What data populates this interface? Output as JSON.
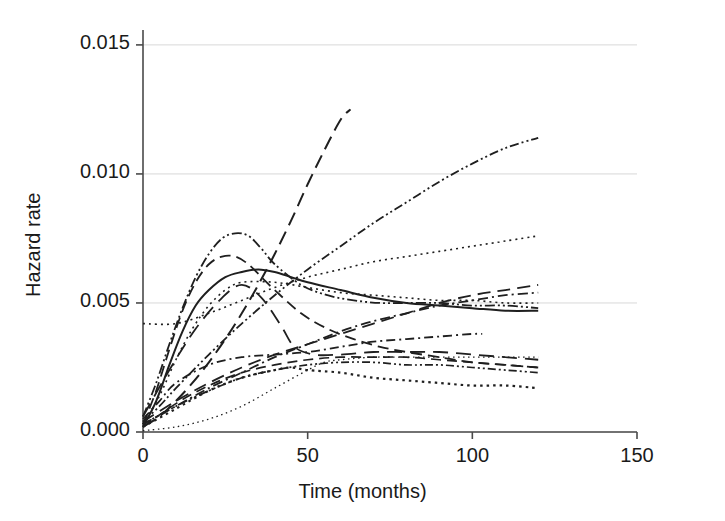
{
  "chart_data": {
    "type": "line",
    "title": "",
    "subtitle": "",
    "xlabel": "Time (months)",
    "ylabel": "Hazard rate",
    "xlim": [
      0,
      150
    ],
    "ylim": [
      0.0,
      0.0155
    ],
    "xticks": [
      0,
      50,
      100,
      150
    ],
    "xtick_labels": [
      "0",
      "50",
      "100",
      "150"
    ],
    "yticks": [
      0.0,
      0.005,
      0.01,
      0.015
    ],
    "ytick_labels": [
      "0.000",
      "0.005",
      "0.010",
      "0.015"
    ],
    "grid": "horizontal-only",
    "legend": "none",
    "legend_position": "none",
    "annotations": [],
    "line_color": "#1f1f1f",
    "grid_color": "#d8d8d8",
    "axis_color": "#4a4a4a",
    "background_color": "#ffffff",
    "note": "Smoothed hazard-rate curves for multiple groups; each line is a distinct dash style, all plotted in black.",
    "series": [
      {
        "name": "steep-long-dash",
        "style": "long-dash",
        "dasharray": "14,7",
        "width": 2.0,
        "x": [
          0,
          5,
          10,
          15,
          20,
          25,
          30,
          35,
          40,
          45,
          50,
          55,
          60,
          63
        ],
        "y": [
          0.0002,
          0.0006,
          0.0012,
          0.0019,
          0.0027,
          0.0036,
          0.0046,
          0.0057,
          0.0069,
          0.0082,
          0.0096,
          0.0109,
          0.0121,
          0.0125
        ]
      },
      {
        "name": "rising-dash-dot-dot",
        "style": "dash-dot-dot",
        "dasharray": "9,3,2,3,2,3",
        "width": 1.8,
        "x": [
          0,
          5,
          10,
          20,
          30,
          40,
          50,
          60,
          70,
          80,
          90,
          100,
          110,
          120
        ],
        "y": [
          0.0004,
          0.001,
          0.0017,
          0.003,
          0.0042,
          0.0053,
          0.0063,
          0.0072,
          0.0081,
          0.0089,
          0.0097,
          0.0104,
          0.011,
          0.0114
        ]
      },
      {
        "name": "peaked-dash-dot-dot",
        "style": "dash-dot-dot",
        "dasharray": "10,3,2,3,2,3",
        "width": 1.8,
        "x": [
          0,
          4,
          8,
          12,
          16,
          20,
          24,
          28,
          32,
          36,
          40,
          48,
          56,
          64,
          72,
          80,
          90,
          100,
          110,
          120
        ],
        "y": [
          0.0006,
          0.0019,
          0.0034,
          0.0048,
          0.006,
          0.0069,
          0.0075,
          0.0077,
          0.0076,
          0.0071,
          0.0065,
          0.0057,
          0.0053,
          0.0051,
          0.005,
          0.005,
          0.005,
          0.0049,
          0.0049,
          0.0048
        ]
      },
      {
        "name": "peaked-medium-dash",
        "style": "dash",
        "dasharray": "11,6",
        "width": 1.8,
        "x": [
          0,
          4,
          8,
          12,
          16,
          20,
          24,
          28,
          32,
          36,
          40,
          48,
          56,
          64,
          72,
          80,
          90,
          100,
          110,
          120
        ],
        "y": [
          0.0003,
          0.0016,
          0.0032,
          0.0047,
          0.0058,
          0.0065,
          0.0068,
          0.0068,
          0.0065,
          0.006,
          0.0055,
          0.0046,
          0.004,
          0.0036,
          0.0033,
          0.0031,
          0.0029,
          0.0027,
          0.0026,
          0.0025
        ]
      },
      {
        "name": "solid-hump",
        "style": "solid",
        "dasharray": "none",
        "width": 2.0,
        "x": [
          0,
          4,
          8,
          12,
          16,
          20,
          25,
          30,
          35,
          40,
          45,
          50,
          60,
          70,
          80,
          90,
          100,
          110,
          120
        ],
        "y": [
          0.0002,
          0.0012,
          0.0026,
          0.0039,
          0.0049,
          0.0055,
          0.006,
          0.0062,
          0.0063,
          0.0062,
          0.006,
          0.0058,
          0.0055,
          0.0052,
          0.005,
          0.0049,
          0.0048,
          0.0047,
          0.0047
        ]
      },
      {
        "name": "fine-dotted-rising",
        "style": "dotted",
        "dasharray": "2,4",
        "width": 1.6,
        "x": [
          0,
          10,
          20,
          30,
          40,
          50,
          60,
          70,
          80,
          90,
          100,
          110,
          120
        ],
        "y": [
          0.0042,
          0.0042,
          0.0046,
          0.0051,
          0.0056,
          0.006,
          0.0063,
          0.0066,
          0.0068,
          0.007,
          0.0072,
          0.0074,
          0.0076
        ]
      },
      {
        "name": "dotted-crossing",
        "style": "dotted",
        "dasharray": "2,4",
        "width": 1.6,
        "x": [
          0,
          5,
          10,
          15,
          20,
          25,
          30,
          40,
          50,
          60,
          70,
          80,
          90,
          100,
          110,
          120
        ],
        "y": [
          0.0003,
          0.0014,
          0.0028,
          0.004,
          0.0049,
          0.0055,
          0.0058,
          0.0058,
          0.0056,
          0.0054,
          0.0053,
          0.0052,
          0.0051,
          0.0051,
          0.005,
          0.005
        ]
      },
      {
        "name": "rising-dash-long",
        "style": "long-dash",
        "dasharray": "13,7",
        "width": 1.8,
        "x": [
          0,
          10,
          20,
          30,
          40,
          50,
          60,
          70,
          80,
          90,
          100,
          110,
          120
        ],
        "y": [
          0.0004,
          0.0012,
          0.0019,
          0.0025,
          0.003,
          0.0034,
          0.0038,
          0.0042,
          0.0046,
          0.005,
          0.0053,
          0.0055,
          0.0057
        ]
      },
      {
        "name": "rising-dash-dot",
        "style": "dash-dot",
        "dasharray": "10,4,2,4",
        "width": 1.8,
        "x": [
          0,
          10,
          20,
          30,
          40,
          50,
          60,
          70,
          80,
          90,
          100,
          110,
          120
        ],
        "y": [
          0.0003,
          0.001,
          0.0017,
          0.0023,
          0.0029,
          0.0034,
          0.0039,
          0.0043,
          0.0046,
          0.0049,
          0.0051,
          0.0053,
          0.0054
        ]
      },
      {
        "name": "plateau-dash-dot",
        "style": "dash-dot",
        "dasharray": "9,4,2,4",
        "width": 1.8,
        "x": [
          0,
          5,
          10,
          20,
          30,
          40,
          50,
          60,
          70,
          80,
          90,
          100,
          103
        ],
        "y": [
          0.0005,
          0.0012,
          0.0019,
          0.0026,
          0.0029,
          0.003,
          0.0031,
          0.0033,
          0.0035,
          0.0036,
          0.0037,
          0.0038,
          0.0038
        ]
      },
      {
        "name": "v-shape-long-dash",
        "style": "long-dash",
        "dasharray": "15,8",
        "width": 1.8,
        "x": [
          0,
          8,
          16,
          24,
          30,
          36,
          42,
          46,
          52,
          60,
          70,
          80,
          90,
          100,
          110,
          120
        ],
        "y": [
          0.0006,
          0.0024,
          0.004,
          0.0052,
          0.0057,
          0.0052,
          0.0041,
          0.0033,
          0.003,
          0.003,
          0.0031,
          0.0031,
          0.0031,
          0.003,
          0.0029,
          0.0028
        ]
      },
      {
        "name": "low-flat-dash",
        "style": "dash",
        "dasharray": "10,6",
        "width": 1.7,
        "x": [
          0,
          10,
          20,
          30,
          40,
          50,
          60,
          70,
          80,
          90,
          100,
          110,
          120
        ],
        "y": [
          0.0002,
          0.0011,
          0.0018,
          0.0023,
          0.0026,
          0.0028,
          0.0029,
          0.0029,
          0.0029,
          0.0028,
          0.0027,
          0.0026,
          0.0025
        ]
      },
      {
        "name": "low-dash-dot-dot",
        "style": "dash-dot-dot",
        "dasharray": "8,3,2,3,2,3",
        "width": 1.7,
        "x": [
          0,
          10,
          20,
          30,
          40,
          50,
          60,
          70,
          80,
          90,
          100,
          110,
          120
        ],
        "y": [
          0.0003,
          0.001,
          0.0016,
          0.0021,
          0.0024,
          0.0026,
          0.0027,
          0.0027,
          0.0026,
          0.0026,
          0.0025,
          0.0024,
          0.0023
        ]
      },
      {
        "name": "bold-dotted-low",
        "style": "thick-dotted",
        "dasharray": "2.5,4",
        "width": 2.2,
        "x": [
          0,
          10,
          20,
          30,
          40,
          45,
          50,
          60,
          70,
          80,
          90,
          100,
          110,
          120
        ],
        "y": [
          0.0002,
          0.0009,
          0.0016,
          0.0021,
          0.0024,
          0.0025,
          0.0024,
          0.0023,
          0.0021,
          0.002,
          0.0019,
          0.0018,
          0.0018,
          0.0017
        ]
      },
      {
        "name": "faint-dotted-late-rise",
        "style": "fine-dotted",
        "dasharray": "1.5,3.5",
        "width": 1.3,
        "x": [
          0,
          10,
          20,
          30,
          40,
          50,
          55,
          60,
          70,
          80,
          90,
          100,
          110,
          120
        ],
        "y": [
          5e-05,
          0.0002,
          0.0005,
          0.001,
          0.0017,
          0.0024,
          0.0027,
          0.0028,
          0.0029,
          0.0029,
          0.0029,
          0.0029,
          0.0029,
          0.0029
        ]
      }
    ]
  },
  "axes": {
    "ylabel": "Hazard rate",
    "xlabel": "Time (months)"
  }
}
